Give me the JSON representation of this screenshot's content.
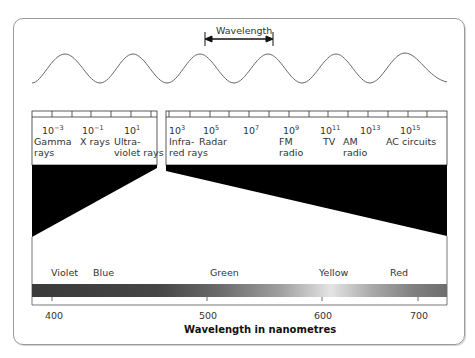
{
  "wave": {
    "label": "Wavelength"
  },
  "spectrum": {
    "left_bands": [
      {
        "exp": "10",
        "sup": "−3",
        "line1": "Gamma",
        "line2": "rays"
      },
      {
        "exp": "10",
        "sup": "−1",
        "line1": "X rays",
        "line2": ""
      },
      {
        "exp": "10",
        "sup": "1",
        "line1": "Ultra-",
        "line2": "violet rays"
      }
    ],
    "right_bands": [
      {
        "exp": "10",
        "sup": "3",
        "line1": "Infra-",
        "line2": "red rays"
      },
      {
        "exp": "10",
        "sup": "5",
        "line1": "Radar",
        "line2": ""
      },
      {
        "exp": "10",
        "sup": "7",
        "line1": "",
        "line2": ""
      },
      {
        "exp": "10",
        "sup": "9",
        "line1": "FM",
        "line2": "radio"
      },
      {
        "exp": "10",
        "sup": "11",
        "line1": "TV",
        "line2": ""
      },
      {
        "exp": "10",
        "sup": "13",
        "line1": "AM",
        "line2": "radio"
      },
      {
        "exp": "10",
        "sup": "15",
        "line1": "AC circuits",
        "line2": ""
      }
    ]
  },
  "visible": {
    "colors": [
      "Violet",
      "Blue",
      "Green",
      "Yellow",
      "Red"
    ],
    "ticks": [
      "400",
      "500",
      "600",
      "700"
    ],
    "axis_title": "Wavelength in nanometres"
  }
}
